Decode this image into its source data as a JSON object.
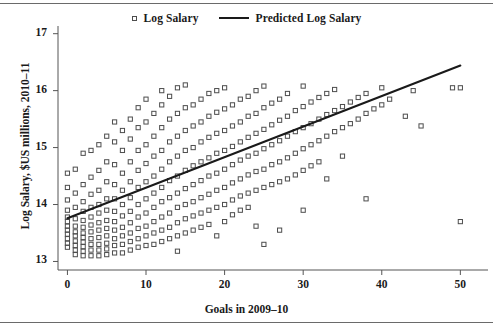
{
  "chart_data": {
    "type": "scatter",
    "title": "",
    "xlabel": "Goals in 2009–10",
    "ylabel": "Log Salary, $US millions, 2010–11",
    "xlim": [
      -1.2,
      52.5
    ],
    "ylim": [
      12.85,
      17.1
    ],
    "xticks": [
      0,
      10,
      20,
      30,
      40,
      50
    ],
    "yticks": [
      13,
      14,
      15,
      16,
      17
    ],
    "xtick_labels": [
      "0",
      "10",
      "20",
      "30",
      "40",
      "50"
    ],
    "ytick_labels": [
      "13",
      "14",
      "15",
      "16",
      "17"
    ],
    "grid": false,
    "legend_position": "top-center",
    "legend": [
      {
        "label": "Log Salary",
        "marker": "open-square",
        "color": "#4d4d4d"
      },
      {
        "label": "Predicted Log Salary",
        "marker": "line",
        "color": "#1a1a1a"
      }
    ],
    "series": [
      {
        "name": "Log Salary",
        "type": "scatter",
        "marker": "open-square",
        "color": "#4d4d4d",
        "points": [
          [
            0,
            13.25
          ],
          [
            0,
            13.32
          ],
          [
            0,
            13.4
          ],
          [
            0,
            13.48
          ],
          [
            0,
            13.55
          ],
          [
            0,
            13.62
          ],
          [
            0,
            13.7
          ],
          [
            0,
            13.78
          ],
          [
            0,
            13.9
          ],
          [
            0,
            14.08
          ],
          [
            0,
            14.3
          ],
          [
            0,
            14.55
          ],
          [
            1,
            13.12
          ],
          [
            1,
            13.2
          ],
          [
            1,
            13.28
          ],
          [
            1,
            13.36
          ],
          [
            1,
            13.45
          ],
          [
            1,
            13.52
          ],
          [
            1,
            13.62
          ],
          [
            1,
            13.75
          ],
          [
            1,
            13.95
          ],
          [
            1,
            14.2
          ],
          [
            1,
            14.62
          ],
          [
            2,
            13.1
          ],
          [
            2,
            13.18
          ],
          [
            2,
            13.26
          ],
          [
            2,
            13.34
          ],
          [
            2,
            13.42
          ],
          [
            2,
            13.5
          ],
          [
            2,
            13.6
          ],
          [
            2,
            13.72
          ],
          [
            2,
            13.88
          ],
          [
            2,
            14.05
          ],
          [
            2,
            14.35
          ],
          [
            2,
            14.9
          ],
          [
            3,
            13.1
          ],
          [
            3,
            13.2
          ],
          [
            3,
            13.3
          ],
          [
            3,
            13.4
          ],
          [
            3,
            13.52
          ],
          [
            3,
            13.64
          ],
          [
            3,
            13.78
          ],
          [
            3,
            13.95
          ],
          [
            3,
            14.18
          ],
          [
            3,
            14.48
          ],
          [
            3,
            14.95
          ],
          [
            4,
            13.1
          ],
          [
            4,
            13.2
          ],
          [
            4,
            13.3
          ],
          [
            4,
            13.42
          ],
          [
            4,
            13.55
          ],
          [
            4,
            13.68
          ],
          [
            4,
            13.85
          ],
          [
            4,
            14.0
          ],
          [
            4,
            14.25
          ],
          [
            4,
            14.6
          ],
          [
            4,
            15.05
          ],
          [
            5,
            13.12
          ],
          [
            5,
            13.22
          ],
          [
            5,
            13.32
          ],
          [
            5,
            13.45
          ],
          [
            5,
            13.58
          ],
          [
            5,
            13.72
          ],
          [
            5,
            13.9
          ],
          [
            5,
            14.1
          ],
          [
            5,
            14.4
          ],
          [
            5,
            14.75
          ],
          [
            5,
            15.2
          ],
          [
            6,
            13.15
          ],
          [
            6,
            13.28
          ],
          [
            6,
            13.4
          ],
          [
            6,
            13.55
          ],
          [
            6,
            13.7
          ],
          [
            6,
            13.88
          ],
          [
            6,
            14.1
          ],
          [
            6,
            14.35
          ],
          [
            6,
            14.7
          ],
          [
            6,
            15.1
          ],
          [
            6,
            15.45
          ],
          [
            7,
            13.15
          ],
          [
            7,
            13.3
          ],
          [
            7,
            13.45
          ],
          [
            7,
            13.6
          ],
          [
            7,
            13.8
          ],
          [
            7,
            14.0
          ],
          [
            7,
            14.25
          ],
          [
            7,
            14.55
          ],
          [
            7,
            14.95
          ],
          [
            7,
            15.3
          ],
          [
            8,
            13.2
          ],
          [
            8,
            13.35
          ],
          [
            8,
            13.5
          ],
          [
            8,
            13.68
          ],
          [
            8,
            13.88
          ],
          [
            8,
            14.12
          ],
          [
            8,
            14.4
          ],
          [
            8,
            14.75
          ],
          [
            8,
            15.15
          ],
          [
            8,
            15.5
          ],
          [
            9,
            13.25
          ],
          [
            9,
            13.4
          ],
          [
            9,
            13.58
          ],
          [
            9,
            13.78
          ],
          [
            9,
            14.0
          ],
          [
            9,
            14.3
          ],
          [
            9,
            14.6
          ],
          [
            9,
            14.95
          ],
          [
            9,
            15.35
          ],
          [
            9,
            15.7
          ],
          [
            10,
            13.28
          ],
          [
            10,
            13.45
          ],
          [
            10,
            13.62
          ],
          [
            10,
            13.85
          ],
          [
            10,
            14.1
          ],
          [
            10,
            14.4
          ],
          [
            10,
            14.72
          ],
          [
            10,
            15.05
          ],
          [
            10,
            15.45
          ],
          [
            10,
            15.85
          ],
          [
            11,
            13.3
          ],
          [
            11,
            13.5
          ],
          [
            11,
            13.7
          ],
          [
            11,
            13.95
          ],
          [
            11,
            14.2
          ],
          [
            11,
            14.5
          ],
          [
            11,
            14.85
          ],
          [
            11,
            15.2
          ],
          [
            11,
            15.6
          ],
          [
            12,
            13.35
          ],
          [
            12,
            13.55
          ],
          [
            12,
            13.78
          ],
          [
            12,
            14.05
          ],
          [
            12,
            14.3
          ],
          [
            12,
            14.62
          ],
          [
            12,
            14.95
          ],
          [
            12,
            15.35
          ],
          [
            12,
            15.75
          ],
          [
            12,
            16.0
          ],
          [
            13,
            13.4
          ],
          [
            13,
            13.6
          ],
          [
            13,
            13.85
          ],
          [
            13,
            14.12
          ],
          [
            13,
            14.42
          ],
          [
            13,
            14.75
          ],
          [
            13,
            15.1
          ],
          [
            13,
            15.5
          ],
          [
            13,
            15.9
          ],
          [
            14,
            13.18
          ],
          [
            14,
            13.45
          ],
          [
            14,
            13.68
          ],
          [
            14,
            13.95
          ],
          [
            14,
            14.2
          ],
          [
            14,
            14.5
          ],
          [
            14,
            14.85
          ],
          [
            14,
            15.2
          ],
          [
            14,
            15.6
          ],
          [
            14,
            16.05
          ],
          [
            15,
            13.5
          ],
          [
            15,
            13.75
          ],
          [
            15,
            14.0
          ],
          [
            15,
            14.28
          ],
          [
            15,
            14.6
          ],
          [
            15,
            14.95
          ],
          [
            15,
            15.3
          ],
          [
            15,
            15.7
          ],
          [
            15,
            16.1
          ],
          [
            16,
            13.55
          ],
          [
            16,
            13.8
          ],
          [
            16,
            14.05
          ],
          [
            16,
            14.35
          ],
          [
            16,
            14.68
          ],
          [
            16,
            15.0
          ],
          [
            16,
            15.38
          ],
          [
            16,
            15.75
          ],
          [
            17,
            13.6
          ],
          [
            17,
            13.85
          ],
          [
            17,
            14.12
          ],
          [
            17,
            14.42
          ],
          [
            17,
            14.75
          ],
          [
            17,
            15.1
          ],
          [
            17,
            15.45
          ],
          [
            17,
            15.85
          ],
          [
            18,
            13.65
          ],
          [
            18,
            13.9
          ],
          [
            18,
            14.18
          ],
          [
            18,
            14.5
          ],
          [
            18,
            14.82
          ],
          [
            18,
            15.18
          ],
          [
            18,
            15.55
          ],
          [
            18,
            15.95
          ],
          [
            19,
            13.45
          ],
          [
            19,
            13.95
          ],
          [
            19,
            14.25
          ],
          [
            19,
            14.55
          ],
          [
            19,
            14.9
          ],
          [
            19,
            15.25
          ],
          [
            19,
            15.62
          ],
          [
            19,
            16.0
          ],
          [
            20,
            13.7
          ],
          [
            20,
            14.0
          ],
          [
            20,
            14.3
          ],
          [
            20,
            14.62
          ],
          [
            20,
            14.95
          ],
          [
            20,
            15.3
          ],
          [
            20,
            15.68
          ],
          [
            20,
            16.05
          ],
          [
            21,
            13.82
          ],
          [
            21,
            14.08
          ],
          [
            21,
            14.38
          ],
          [
            21,
            14.7
          ],
          [
            21,
            15.02
          ],
          [
            21,
            15.38
          ],
          [
            21,
            15.75
          ],
          [
            22,
            13.9
          ],
          [
            22,
            14.15
          ],
          [
            22,
            14.45
          ],
          [
            22,
            14.78
          ],
          [
            22,
            15.1
          ],
          [
            22,
            15.45
          ],
          [
            22,
            15.85
          ],
          [
            23,
            13.95
          ],
          [
            23,
            14.2
          ],
          [
            23,
            14.52
          ],
          [
            23,
            14.85
          ],
          [
            23,
            15.18
          ],
          [
            23,
            15.55
          ],
          [
            23,
            15.9
          ],
          [
            24,
            13.62
          ],
          [
            24,
            14.25
          ],
          [
            24,
            14.58
          ],
          [
            24,
            14.9
          ],
          [
            24,
            15.25
          ],
          [
            24,
            15.6
          ],
          [
            24,
            16.0
          ],
          [
            25,
            13.3
          ],
          [
            25,
            14.3
          ],
          [
            25,
            14.62
          ],
          [
            25,
            14.98
          ],
          [
            25,
            15.32
          ],
          [
            25,
            15.7
          ],
          [
            25,
            16.08
          ],
          [
            26,
            14.35
          ],
          [
            26,
            14.7
          ],
          [
            26,
            15.05
          ],
          [
            26,
            15.4
          ],
          [
            26,
            15.78
          ],
          [
            27,
            13.55
          ],
          [
            27,
            14.4
          ],
          [
            27,
            14.75
          ],
          [
            27,
            15.12
          ],
          [
            27,
            15.48
          ],
          [
            27,
            15.85
          ],
          [
            28,
            14.45
          ],
          [
            28,
            14.82
          ],
          [
            28,
            15.2
          ],
          [
            28,
            15.55
          ],
          [
            28,
            15.95
          ],
          [
            29,
            14.52
          ],
          [
            29,
            14.9
          ],
          [
            29,
            15.28
          ],
          [
            29,
            15.65
          ],
          [
            30,
            13.9
          ],
          [
            30,
            14.6
          ],
          [
            30,
            14.98
          ],
          [
            30,
            15.35
          ],
          [
            30,
            15.72
          ],
          [
            30,
            16.08
          ],
          [
            31,
            14.68
          ],
          [
            31,
            15.05
          ],
          [
            31,
            15.42
          ],
          [
            31,
            15.8
          ],
          [
            32,
            14.75
          ],
          [
            32,
            15.12
          ],
          [
            32,
            15.5
          ],
          [
            32,
            15.88
          ],
          [
            33,
            14.45
          ],
          [
            33,
            15.2
          ],
          [
            33,
            15.58
          ],
          [
            33,
            15.95
          ],
          [
            34,
            15.28
          ],
          [
            34,
            15.65
          ],
          [
            34,
            16.02
          ],
          [
            35,
            14.85
          ],
          [
            35,
            15.35
          ],
          [
            35,
            15.72
          ],
          [
            36,
            15.42
          ],
          [
            36,
            15.8
          ],
          [
            37,
            15.5
          ],
          [
            37,
            15.88
          ],
          [
            38,
            14.1
          ],
          [
            38,
            15.6
          ],
          [
            38,
            15.95
          ],
          [
            39,
            15.68
          ],
          [
            40,
            15.75
          ],
          [
            40,
            16.05
          ],
          [
            41,
            15.85
          ],
          [
            43,
            15.55
          ],
          [
            44,
            16.0
          ],
          [
            45,
            15.38
          ],
          [
            49,
            16.05
          ],
          [
            50,
            16.05
          ],
          [
            50,
            13.7
          ]
        ]
      },
      {
        "name": "Predicted Log Salary",
        "type": "line",
        "color": "#1a1a1a",
        "x": [
          0,
          50
        ],
        "y": [
          13.76,
          16.44
        ],
        "slope": 0.0536,
        "intercept": 13.76
      }
    ]
  }
}
